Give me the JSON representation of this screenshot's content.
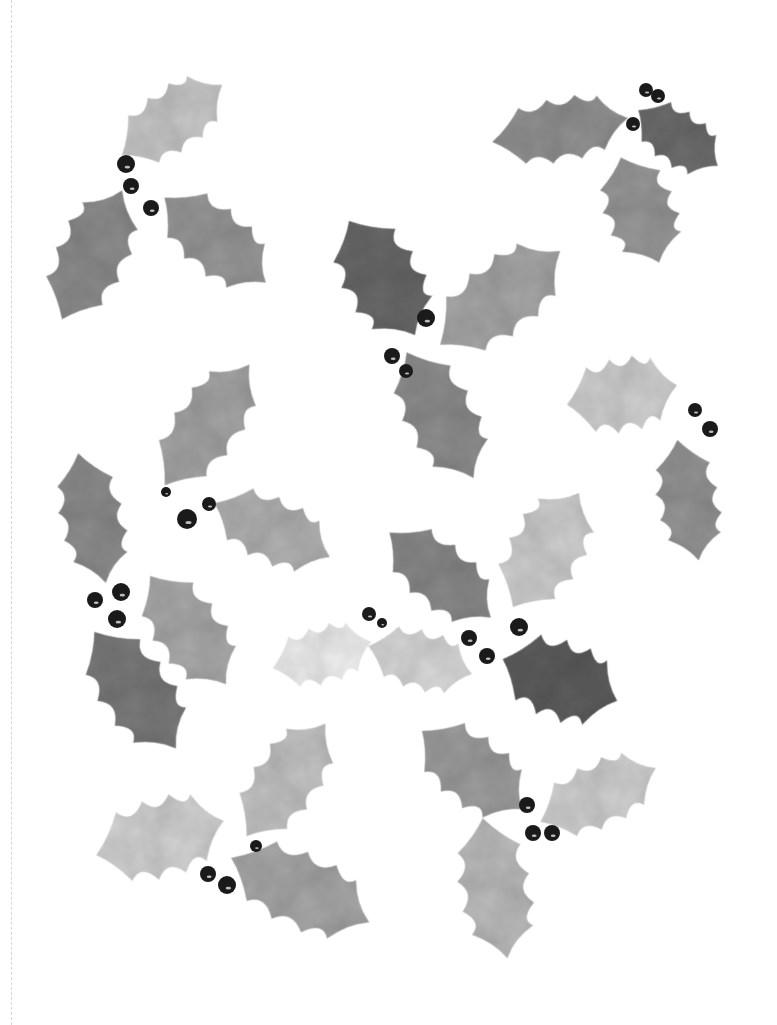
{
  "artwork": {
    "subject": "Watercolor holly leaves and berries",
    "palette": {
      "background": "#ffffff",
      "berry": "#1a1a1a",
      "perforation": "#d6d6d6"
    },
    "leaves": [
      {
        "cx": 172,
        "cy": 120,
        "len": 120,
        "w": 62,
        "rot": -35,
        "fill": "#c9c9c9"
      },
      {
        "cx": 92,
        "cy": 255,
        "len": 140,
        "w": 70,
        "rot": -65,
        "fill": "#8e8e8e"
      },
      {
        "cx": 215,
        "cy": 240,
        "len": 130,
        "w": 66,
        "rot": 40,
        "fill": "#999999"
      },
      {
        "cx": 560,
        "cy": 130,
        "len": 135,
        "w": 62,
        "rot": -10,
        "fill": "#939393"
      },
      {
        "cx": 678,
        "cy": 138,
        "len": 95,
        "w": 54,
        "rot": 35,
        "fill": "#6e6e6e"
      },
      {
        "cx": 640,
        "cy": 210,
        "len": 110,
        "w": 70,
        "rot": 70,
        "fill": "#9a9a9a"
      },
      {
        "cx": 382,
        "cy": 278,
        "len": 130,
        "w": 78,
        "rot": 60,
        "fill": "#6a6a6a"
      },
      {
        "cx": 500,
        "cy": 298,
        "len": 150,
        "w": 74,
        "rot": -38,
        "fill": "#a8a8a8"
      },
      {
        "cx": 440,
        "cy": 415,
        "len": 140,
        "w": 70,
        "rot": 62,
        "fill": "#8f8f8f"
      },
      {
        "cx": 622,
        "cy": 395,
        "len": 110,
        "w": 72,
        "rot": -10,
        "fill": "#d2d2d2"
      },
      {
        "cx": 688,
        "cy": 500,
        "len": 120,
        "w": 60,
        "rot": 80,
        "fill": "#969696"
      },
      {
        "cx": 207,
        "cy": 425,
        "len": 145,
        "w": 66,
        "rot": -55,
        "fill": "#a6a6a6"
      },
      {
        "cx": 272,
        "cy": 530,
        "len": 125,
        "w": 64,
        "rot": 25,
        "fill": "#b3b3b3"
      },
      {
        "cx": 92,
        "cy": 518,
        "len": 130,
        "w": 62,
        "rot": 78,
        "fill": "#8e8e8e"
      },
      {
        "cx": 188,
        "cy": 630,
        "len": 130,
        "w": 68,
        "rot": 55,
        "fill": "#ababab"
      },
      {
        "cx": 135,
        "cy": 690,
        "len": 140,
        "w": 72,
        "rot": 55,
        "fill": "#7c7c7c"
      },
      {
        "cx": 440,
        "cy": 575,
        "len": 130,
        "w": 64,
        "rot": 40,
        "fill": "#8a8a8a"
      },
      {
        "cx": 546,
        "cy": 550,
        "len": 130,
        "w": 74,
        "rot": -60,
        "fill": "#d0d0d0"
      },
      {
        "cx": 560,
        "cy": 680,
        "len": 120,
        "w": 78,
        "rot": 20,
        "fill": "#5f5f5f"
      },
      {
        "cx": 322,
        "cy": 655,
        "len": 100,
        "w": 56,
        "rot": -15,
        "fill": "#f1f1f1"
      },
      {
        "cx": 420,
        "cy": 660,
        "len": 105,
        "w": 58,
        "rot": 15,
        "fill": "#dadada"
      },
      {
        "cx": 160,
        "cy": 838,
        "len": 130,
        "w": 78,
        "rot": -15,
        "fill": "#d4d4d4"
      },
      {
        "cx": 286,
        "cy": 780,
        "len": 135,
        "w": 66,
        "rot": -55,
        "fill": "#c5c5c5"
      },
      {
        "cx": 300,
        "cy": 890,
        "len": 150,
        "w": 74,
        "rot": 25,
        "fill": "#a9a9a9"
      },
      {
        "cx": 472,
        "cy": 770,
        "len": 125,
        "w": 70,
        "rot": 38,
        "fill": "#9f9f9f"
      },
      {
        "cx": 598,
        "cy": 795,
        "len": 125,
        "w": 64,
        "rot": -25,
        "fill": "#d2d2d2"
      },
      {
        "cx": 495,
        "cy": 888,
        "len": 140,
        "w": 70,
        "rot": 80,
        "fill": "#bdbdbd"
      }
    ],
    "berries": [
      {
        "cx": 126,
        "cy": 164,
        "r": 9
      },
      {
        "cx": 131,
        "cy": 186,
        "r": 8
      },
      {
        "cx": 151,
        "cy": 208,
        "r": 8
      },
      {
        "cx": 646,
        "cy": 90,
        "r": 7
      },
      {
        "cx": 658,
        "cy": 96,
        "r": 7
      },
      {
        "cx": 633,
        "cy": 124,
        "r": 7
      },
      {
        "cx": 426,
        "cy": 318,
        "r": 9
      },
      {
        "cx": 392,
        "cy": 356,
        "r": 8
      },
      {
        "cx": 406,
        "cy": 371,
        "r": 7
      },
      {
        "cx": 695,
        "cy": 410,
        "r": 7
      },
      {
        "cx": 710,
        "cy": 429,
        "r": 8
      },
      {
        "cx": 166,
        "cy": 492,
        "r": 5
      },
      {
        "cx": 209,
        "cy": 504,
        "r": 7
      },
      {
        "cx": 187,
        "cy": 519,
        "r": 10
      },
      {
        "cx": 95,
        "cy": 600,
        "r": 8
      },
      {
        "cx": 121,
        "cy": 592,
        "r": 9
      },
      {
        "cx": 117,
        "cy": 619,
        "r": 9
      },
      {
        "cx": 369,
        "cy": 614,
        "r": 7
      },
      {
        "cx": 382,
        "cy": 623,
        "r": 5
      },
      {
        "cx": 469,
        "cy": 638,
        "r": 8
      },
      {
        "cx": 487,
        "cy": 656,
        "r": 8
      },
      {
        "cx": 519,
        "cy": 627,
        "r": 9
      },
      {
        "cx": 256,
        "cy": 846,
        "r": 6
      },
      {
        "cx": 208,
        "cy": 874,
        "r": 8
      },
      {
        "cx": 227,
        "cy": 885,
        "r": 9
      },
      {
        "cx": 527,
        "cy": 805,
        "r": 8
      },
      {
        "cx": 533,
        "cy": 833,
        "r": 8
      },
      {
        "cx": 552,
        "cy": 833,
        "r": 8
      }
    ]
  }
}
